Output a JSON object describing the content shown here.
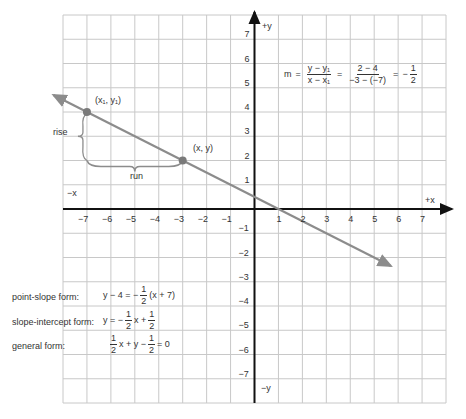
{
  "graph": {
    "x_range": [
      -8,
      8
    ],
    "y_range": [
      -8,
      8
    ],
    "x_ticks": [
      "-7",
      "-6",
      "-5",
      "-4",
      "-3",
      "-2",
      "-1",
      "1",
      "2",
      "3",
      "4",
      "5",
      "6",
      "7"
    ],
    "y_ticks": [
      "7",
      "6",
      "5",
      "4",
      "3",
      "2",
      "1",
      "-1",
      "-2",
      "-3",
      "-4",
      "-5",
      "-6",
      "-7"
    ],
    "axis_labels": {
      "pos_x": "+x",
      "neg_x": "−x",
      "pos_y": "+y",
      "neg_y": "−y"
    },
    "line_color": "#8c8c8c",
    "grid_color": "#c8c8c8",
    "axis_color": "#111111",
    "line": {
      "slope": "-1/2",
      "intercept": "1/2",
      "from": [
        -8.4,
        4.7
      ],
      "to": [
        5.7,
        -2.35
      ]
    },
    "points": [
      {
        "x": -7,
        "y": 4,
        "label": "(x₁, y₁)"
      },
      {
        "x": -3,
        "y": 2,
        "label": "(x, y)"
      }
    ],
    "annotations": {
      "rise": "rise",
      "run": "run"
    }
  },
  "slope_formula": {
    "lhs": "m",
    "eq": "=",
    "frac1_num": "y − y₁",
    "frac1_den": "x − x₁",
    "frac2_num": "2 − 4",
    "frac2_den": "−3 − (−7)",
    "neg": "−",
    "frac3_num": "1",
    "frac3_den": "2"
  },
  "forms": {
    "point_slope": {
      "label": "point-slope form:",
      "pre": "y − 4 = −",
      "num": "1",
      "den": "2",
      "post": "(x + 7)"
    },
    "slope_intercept": {
      "label": "slope-intercept form:",
      "pre": "y = −",
      "num": "1",
      "den": "2",
      "mid": "x +",
      "num2": "1",
      "den2": "2"
    },
    "general": {
      "label": "general form:",
      "num": "1",
      "den": "2",
      "mid": "x + y −",
      "num2": "1",
      "den2": "2",
      "post": "= 0"
    }
  }
}
